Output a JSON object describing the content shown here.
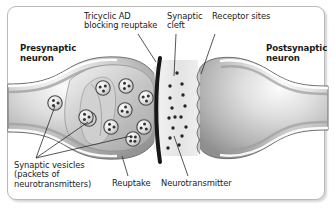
{
  "figure": {
    "background_color": "#ffffff",
    "frame_color": "#b9b9b9",
    "text_color": "#1b1b1b"
  },
  "labels": {
    "tricyclic": "Tricyclic AD\nblocking reuptake",
    "synaptic_cleft": "Synaptic\ncleft",
    "receptor_sites": "Receptor sites",
    "presynaptic_neuron": "Presynaptic\nneuron",
    "postsynaptic_neuron": "Postsynaptic\nneuron",
    "synaptic_vesicles": "Synaptic vesicles\n(packets of\nneurotransmitters)",
    "reuptake": "Reuptake",
    "neurotransmitter": "Neurotransmitter"
  },
  "diagram": {
    "presynaptic_terminal": {
      "name": "presynaptic-terminal",
      "fill_light": "#f2f2f2",
      "fill_mid": "#c9c9c9",
      "fill_dark": "#9a9a9a",
      "outline": "#707070"
    },
    "postsynaptic_terminal": {
      "name": "postsynaptic-terminal",
      "fill_light": "#f4f4f4",
      "fill_mid": "#c6c6c6",
      "fill_dark": "#a0a0a0",
      "outline": "#6f6f6f",
      "receptor_site_count": 6
    },
    "blocking_bar": {
      "name": "tricyclic-blocking-bar",
      "color": "#171717",
      "thickness": 4
    },
    "vesicles": {
      "radius": 7.2,
      "fill": "#e8e8e8",
      "outline": "#4a4a4a",
      "dot_color": "#333333",
      "positions": [
        {
          "cx": 55,
          "cy": 103,
          "dots": 3
        },
        {
          "cx": 89,
          "cy": 119,
          "dots": 3
        },
        {
          "cx": 103,
          "cy": 88,
          "dots": 3
        },
        {
          "cx": 126,
          "cy": 86,
          "dots": 3
        },
        {
          "cx": 125,
          "cy": 110,
          "dots": 3
        },
        {
          "cx": 146,
          "cy": 98,
          "dots": 3
        },
        {
          "cx": 111,
          "cy": 127,
          "dots": 3
        },
        {
          "cx": 144,
          "cy": 127,
          "dots": 3
        },
        {
          "cx": 133,
          "cy": 139,
          "dots": 4
        },
        {
          "cx": 86,
          "cy": 117,
          "dots": 3
        }
      ]
    },
    "neurotransmitters": {
      "name": "neurotransmitter-dots",
      "color": "#252525",
      "radius": 1.7,
      "positions": [
        {
          "cx": 170,
          "cy": 86
        },
        {
          "cx": 182,
          "cy": 84
        },
        {
          "cx": 170,
          "cy": 98
        },
        {
          "cx": 183,
          "cy": 95
        },
        {
          "cx": 172,
          "cy": 108
        },
        {
          "cx": 185,
          "cy": 106
        },
        {
          "cx": 169,
          "cy": 118
        },
        {
          "cx": 181,
          "cy": 117
        },
        {
          "cx": 173,
          "cy": 128
        },
        {
          "cx": 186,
          "cy": 127
        },
        {
          "cx": 170,
          "cy": 138
        },
        {
          "cx": 182,
          "cy": 136
        },
        {
          "cx": 168,
          "cy": 148
        },
        {
          "cx": 179,
          "cy": 145
        },
        {
          "cx": 175,
          "cy": 117
        },
        {
          "cx": 177,
          "cy": 73
        }
      ]
    },
    "leader_lines": {
      "color": "#2b2b2b",
      "width": 0.8
    }
  }
}
